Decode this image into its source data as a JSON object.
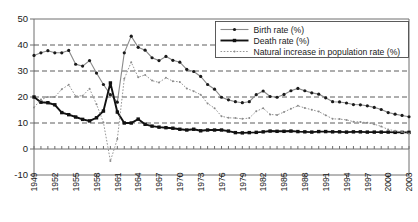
{
  "chart_data": {
    "type": "line",
    "title": "",
    "xlabel": "",
    "ylabel": "",
    "ylim": [
      -10,
      50
    ],
    "ytick_values": [
      -10,
      0,
      10,
      20,
      30,
      40,
      50
    ],
    "ytick_labels": [
      "-10",
      "0",
      "10",
      "20",
      "30",
      "40",
      "50"
    ],
    "grid": "horizontal dashed gridlines at 10, 20, 30, 40; solid axis at 50 (top), 0 and -10",
    "legend_position": "top-right inside plot",
    "xlim": [
      1949,
      2003
    ],
    "x": [
      1949,
      1950,
      1951,
      1952,
      1953,
      1954,
      1955,
      1956,
      1957,
      1958,
      1959,
      1960,
      1961,
      1962,
      1963,
      1964,
      1965,
      1966,
      1967,
      1968,
      1969,
      1970,
      1971,
      1972,
      1973,
      1974,
      1975,
      1976,
      1977,
      1978,
      1979,
      1980,
      1981,
      1982,
      1983,
      1984,
      1985,
      1986,
      1987,
      1988,
      1989,
      1990,
      1991,
      1992,
      1993,
      1994,
      1995,
      1996,
      1997,
      1998,
      1999,
      2000,
      2001,
      2002,
      2003
    ],
    "xticks": [
      1949,
      1952,
      1955,
      1958,
      1961,
      1964,
      1967,
      1970,
      1973,
      1976,
      1979,
      1982,
      1985,
      1988,
      1991,
      1994,
      1997,
      2000,
      2003
    ],
    "xtick_labels": [
      "1949",
      "1952",
      "1955",
      "1958",
      "1961",
      "1964",
      "1967",
      "1970",
      "1973",
      "1976",
      "1979",
      "1982",
      "1985",
      "1988",
      "1991",
      "1994",
      "1997",
      "2000",
      "2003"
    ],
    "series": [
      {
        "name": "Birth rate (%)",
        "marker": "filled-circle",
        "linestyle": "solid-thin",
        "color": "#8a8a8a",
        "values": [
          36.0,
          37.0,
          37.8,
          37.0,
          37.0,
          37.9,
          32.6,
          31.9,
          34.0,
          29.2,
          24.8,
          20.9,
          18.0,
          37.0,
          43.4,
          39.1,
          38.0,
          35.1,
          34.0,
          35.6,
          34.1,
          33.4,
          30.6,
          29.8,
          27.9,
          24.8,
          23.0,
          19.9,
          18.9,
          18.2,
          17.8,
          18.2,
          20.9,
          22.3,
          20.2,
          19.9,
          21.0,
          22.4,
          23.3,
          22.4,
          21.6,
          21.1,
          19.7,
          18.2,
          18.1,
          17.7,
          17.1,
          17.0,
          16.6,
          16.0,
          15.2,
          14.0,
          13.4,
          12.9,
          12.4
        ]
      },
      {
        "name": "Death rate (%)",
        "marker": "filled-square",
        "linestyle": "solid-thick",
        "color": "#111111",
        "values": [
          20.0,
          18.0,
          17.8,
          17.0,
          14.0,
          13.2,
          12.3,
          11.4,
          10.8,
          12.0,
          14.6,
          25.4,
          14.2,
          10.0,
          10.0,
          11.5,
          9.5,
          8.8,
          8.4,
          8.2,
          8.0,
          7.6,
          7.3,
          7.6,
          7.0,
          7.3,
          7.3,
          7.3,
          6.9,
          6.3,
          6.2,
          6.3,
          6.4,
          6.6,
          6.9,
          6.8,
          6.8,
          6.9,
          6.7,
          6.6,
          6.5,
          6.7,
          6.7,
          6.6,
          6.6,
          6.5,
          6.6,
          6.6,
          6.5,
          6.5,
          6.5,
          6.5,
          6.4,
          6.4,
          6.4
        ]
      },
      {
        "name": "Natural increase in population rate (%)",
        "marker": "small-dot",
        "linestyle": "dotted",
        "color": "#8a8a8a",
        "values": [
          16.0,
          19.0,
          20.0,
          20.0,
          23.0,
          24.7,
          20.3,
          20.5,
          23.2,
          17.2,
          10.2,
          -4.6,
          3.8,
          27.0,
          33.4,
          27.6,
          28.5,
          26.3,
          25.6,
          27.4,
          26.1,
          25.8,
          23.3,
          22.2,
          20.9,
          17.5,
          15.7,
          12.6,
          12.0,
          11.9,
          11.6,
          11.9,
          14.5,
          15.7,
          13.3,
          13.1,
          14.2,
          15.5,
          16.6,
          15.8,
          15.1,
          14.4,
          13.0,
          11.6,
          11.5,
          11.2,
          10.5,
          10.4,
          10.1,
          9.5,
          8.7,
          7.5,
          7.0,
          6.5,
          6.0
        ]
      }
    ]
  },
  "legend": {
    "entries": [
      {
        "label": "Birth rate (%)"
      },
      {
        "label": "Death rate (%)"
      },
      {
        "label": "Natural increase in population rate (%)"
      }
    ]
  },
  "colors": {
    "birth": "#8a8a8a",
    "death": "#111111",
    "natural": "#8a8a8a",
    "axis": "#6e6e6e",
    "grid": "#4a4a4a",
    "background": "#ffffff"
  }
}
